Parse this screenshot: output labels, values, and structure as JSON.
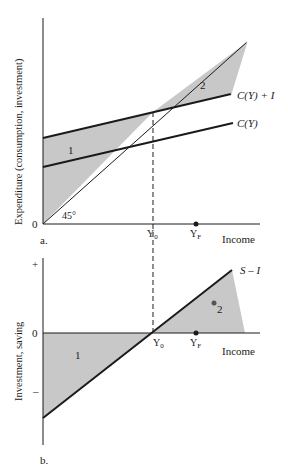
{
  "panel_a": {
    "caption": "a.",
    "y_axis_label": "Expenditure (consumption, investment)",
    "x_axis_label": "Income",
    "origin_label": "0",
    "angle_label": "45°",
    "curves": {
      "aggregate_demand": "C(Y) + I",
      "consumption": "C(Y)"
    },
    "regions": {
      "left": "1",
      "right": "2"
    },
    "x_ticks": {
      "equilibrium": "Y₀",
      "full_employment": "Y_F"
    },
    "x_tick_parts": {
      "y0_main": "Y",
      "y0_sub": "0",
      "yf_main": "Y",
      "yf_sub": "F"
    }
  },
  "panel_b": {
    "caption": "b.",
    "y_axis_label": "Investment, saving",
    "x_axis_label": "Income",
    "y_ticks": {
      "plus": "+",
      "zero": "0",
      "minus": "–"
    },
    "curve": "S – I",
    "regions": {
      "left": "1",
      "right": "2"
    },
    "x_tick_parts": {
      "y0_main": "Y",
      "y0_sub": "0",
      "yf_main": "Y",
      "yf_sub": "F"
    }
  },
  "colors": {
    "shade": "#c8c8c8",
    "ink": "#1a1a1a"
  }
}
